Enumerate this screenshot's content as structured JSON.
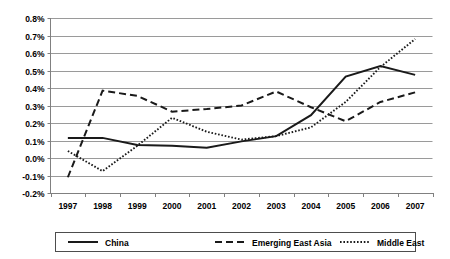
{
  "chart_data": {
    "type": "line",
    "title": "",
    "subtitle": "",
    "xlabel": "",
    "ylabel": "",
    "categories": [
      "1997",
      "1998",
      "1999",
      "2000",
      "2001",
      "2002",
      "2003",
      "2004",
      "2005",
      "2006",
      "2007"
    ],
    "x_tick_labels": [
      "1997",
      "1998",
      "1999",
      "2000",
      "2001",
      "2002",
      "2003",
      "2004",
      "2005",
      "2006",
      "2007"
    ],
    "y_tick_labels": [
      "0.8%",
      "0.7%",
      "0.6%",
      "0.5%",
      "0.4%",
      "0.3%",
      "0.2%",
      "0.1%",
      "0.0%",
      "-0.1%",
      "-0.2%"
    ],
    "y_tick_values": [
      0.8,
      0.7,
      0.6,
      0.5,
      0.4,
      0.3,
      0.2,
      0.1,
      0.0,
      -0.1,
      -0.2
    ],
    "ylim": [
      -0.2,
      0.8
    ],
    "y_unit": "%",
    "grid": true,
    "grid_axis": "y",
    "legend_position": "bottom",
    "series": [
      {
        "name": "China",
        "style": "solid",
        "color": "#1a1a1a",
        "values": [
          0.115,
          0.115,
          0.075,
          0.07,
          0.058,
          0.095,
          0.125,
          0.245,
          0.465,
          0.525,
          0.475
        ]
      },
      {
        "name": "Emerging East Asia",
        "style": "dashed",
        "color": "#1a1a1a",
        "values": [
          -0.11,
          0.385,
          0.355,
          0.265,
          0.28,
          0.3,
          0.38,
          0.29,
          0.21,
          0.32,
          0.375
        ]
      },
      {
        "name": "Middle East",
        "style": "dotted",
        "color": "#1a1a1a",
        "values": [
          0.04,
          -0.075,
          0.07,
          0.23,
          0.15,
          0.105,
          0.125,
          0.175,
          0.32,
          0.52,
          0.68
        ]
      }
    ]
  },
  "legend": {
    "items": [
      {
        "label": "China",
        "style": "solid"
      },
      {
        "label": "Emerging East Asia",
        "style": "dashed"
      },
      {
        "label": "Middle East",
        "style": "dotted"
      }
    ]
  }
}
